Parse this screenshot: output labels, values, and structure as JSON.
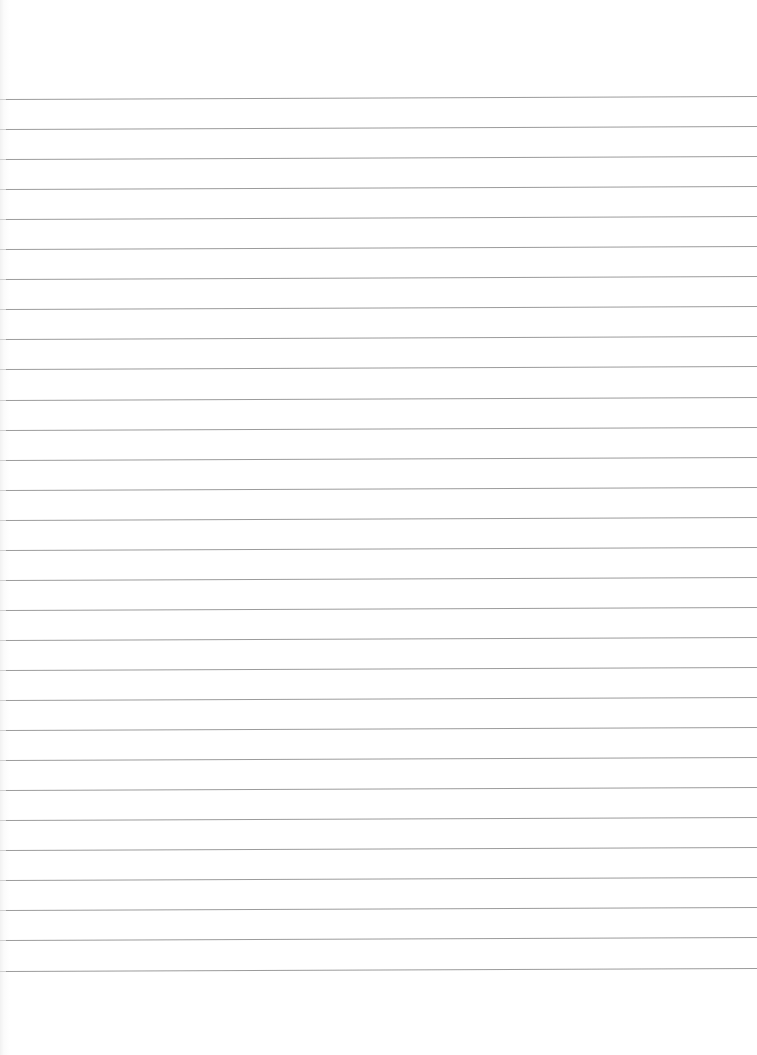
{
  "document": {
    "type": "lined-paper",
    "background_color": "#ffffff",
    "rule_color": "#8a8a8a",
    "rule_count": 30,
    "first_rule_y": 99,
    "rule_spacing": 30.05,
    "content": ""
  }
}
